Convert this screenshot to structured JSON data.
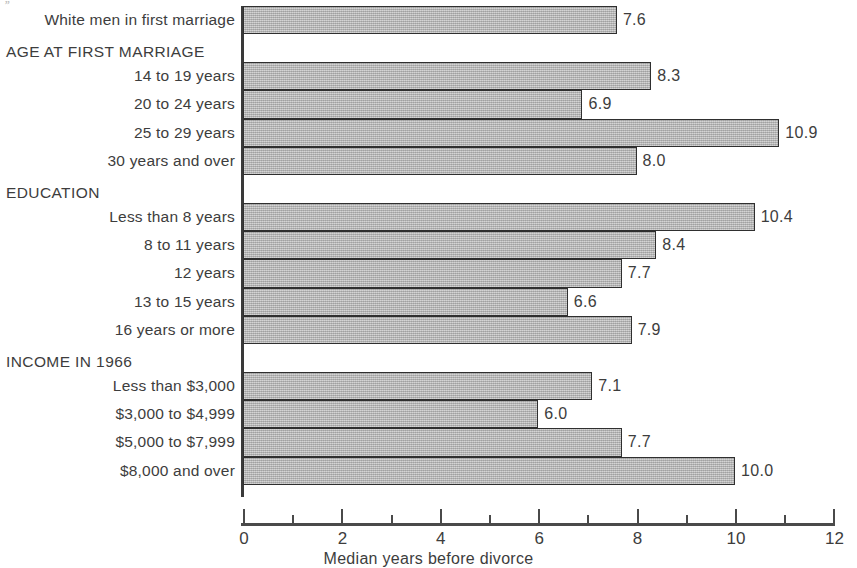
{
  "artifact": {
    "mark": "’’"
  },
  "chart_data": {
    "type": "bar",
    "orientation": "horizontal",
    "title": "",
    "xlabel": "Median years before divorce",
    "ylabel": "",
    "xlim": [
      0,
      12
    ],
    "xticks": [
      0,
      2,
      4,
      6,
      8,
      10,
      12
    ],
    "xtick_labels": [
      "0",
      "2",
      "4",
      "6",
      "8",
      "10",
      "12"
    ],
    "minor_tick_interval": 1,
    "grid": false,
    "legend": "none",
    "bar_fill_color": "#b0b0b0",
    "bar_edge_color": "#2f2f2f",
    "categories": [
      "White men in first marriage",
      "14 to 19 years",
      "20 to 24 years",
      "25 to 29 years",
      "30 years and over",
      "Less than 8 years",
      "8 to 11 years",
      "12 years",
      "13 to 15 years",
      "16 years or more",
      "Less than $3,000",
      "$3,000 to $4,999",
      "$5,000 to $7,999",
      "$8,000 and over"
    ],
    "values": [
      7.6,
      8.3,
      6.9,
      10.9,
      8.0,
      10.4,
      8.4,
      7.7,
      6.6,
      7.9,
      7.1,
      6.0,
      7.7,
      10.0
    ],
    "value_labels": [
      "7.6",
      "8.3",
      "6.9",
      "10.9",
      "8.0",
      "10.4",
      "8.4",
      "7.7",
      "6.6",
      "7.9",
      "7.1",
      "6.0",
      "7.7",
      "10.0"
    ],
    "group_headers": [
      "AGE AT FIRST MARRIAGE",
      "EDUCATION",
      "INCOME IN 1966"
    ],
    "groups": [
      {
        "header": "",
        "rows": [
          {
            "label": "White men in first marriage",
            "value": 7.6,
            "value_label": "7.6"
          }
        ]
      },
      {
        "header": "AGE AT FIRST MARRIAGE",
        "rows": [
          {
            "label": "14 to 19 years",
            "value": 8.3,
            "value_label": "8.3"
          },
          {
            "label": "20 to 24 years",
            "value": 6.9,
            "value_label": "6.9"
          },
          {
            "label": "25 to 29 years",
            "value": 10.9,
            "value_label": "10.9"
          },
          {
            "label": "30 years and over",
            "value": 8.0,
            "value_label": "8.0"
          }
        ]
      },
      {
        "header": "EDUCATION",
        "rows": [
          {
            "label": "Less than 8 years",
            "value": 10.4,
            "value_label": "10.4"
          },
          {
            "label": "8 to 11 years",
            "value": 8.4,
            "value_label": "8.4"
          },
          {
            "label": "12 years",
            "value": 7.7,
            "value_label": "7.7"
          },
          {
            "label": "13 to 15 years",
            "value": 6.6,
            "value_label": "6.6"
          },
          {
            "label": "16 years or more",
            "value": 7.9,
            "value_label": "7.9"
          }
        ]
      },
      {
        "header": "INCOME IN 1966",
        "rows": [
          {
            "label": "Less than $3,000",
            "value": 7.1,
            "value_label": "7.1"
          },
          {
            "label": "$3,000 to $4,999",
            "value": 6.0,
            "value_label": "6.0"
          },
          {
            "label": "$5,000 to $7,999",
            "value": 7.7,
            "value_label": "7.7"
          },
          {
            "label": "$8,000 and over",
            "value": 10.0,
            "value_label": "10.0"
          }
        ]
      }
    ]
  }
}
